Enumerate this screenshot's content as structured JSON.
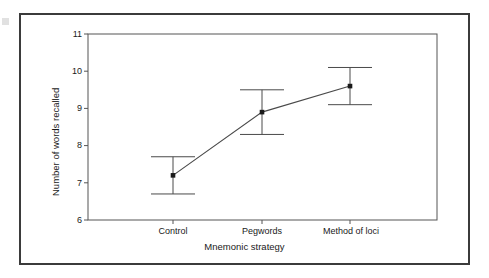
{
  "figure": {
    "name": "mnemonic-strategy-error-bar-chart",
    "has_outer_border": true,
    "border_color": "#3b3b3b",
    "background": "#ffffff"
  },
  "chart_data": {
    "type": "line",
    "title": "",
    "subtitle": "",
    "xlabel": "Mnemonic strategy",
    "ylabel": "Number of words recalled",
    "categories": [
      "Control",
      "Pegwords",
      "Method of loci"
    ],
    "values": [
      7.2,
      8.9,
      9.6
    ],
    "error_low": [
      6.7,
      8.3,
      9.1
    ],
    "error_high": [
      7.7,
      9.5,
      10.1
    ],
    "series": [
      {
        "name": "Mean number of words recalled",
        "values": [
          7.2,
          8.9,
          9.6
        ],
        "error_low": [
          6.7,
          8.3,
          9.1
        ],
        "error_high": [
          7.7,
          9.5,
          10.1
        ]
      }
    ],
    "ylim": [
      6,
      11
    ],
    "yticks": [
      6,
      7,
      8,
      9,
      10,
      11
    ],
    "ytick_labels": [
      "6",
      "7",
      "8",
      "9",
      "10",
      "11"
    ],
    "xtick_labels": [
      "Control",
      "Pegwords",
      "Method of loci"
    ],
    "grid": false,
    "legend": false,
    "legend_position": "none",
    "marker": "filled-square",
    "line_color": "#4a4a4a",
    "marker_color": "#1a1a1a",
    "errorbar_color": "#4a4a4a",
    "axis_color": "#555555"
  },
  "axis": {
    "y_tick_0": "6",
    "y_tick_1": "7",
    "y_tick_2": "8",
    "y_tick_3": "9",
    "y_tick_4": "10",
    "y_tick_5": "11",
    "x_tick_0": "Control",
    "x_tick_1": "Pegwords",
    "x_tick_2": "Method of loci",
    "x_title": "Mnemonic strategy",
    "y_title": "Number of words recalled"
  }
}
